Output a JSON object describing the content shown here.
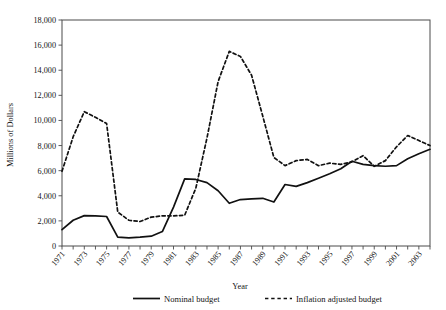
{
  "chart_data": {
    "type": "line",
    "title": "",
    "xlabel": "Year",
    "ylabel": "Millions of Dollars",
    "ylim": [
      0,
      18000
    ],
    "ytick_step": 2000,
    "ytick_labels": [
      "0",
      "2,000",
      "4,000",
      "6,000",
      "8,000",
      "10,000",
      "12,000",
      "14,000",
      "16,000",
      "18,000"
    ],
    "xlim": [
      1971,
      2004
    ],
    "grid": false,
    "legend_position": "bottom",
    "x": [
      1971,
      1972,
      1973,
      1974,
      1975,
      1976,
      1977,
      1978,
      1979,
      1980,
      1981,
      1982,
      1983,
      1984,
      1985,
      1986,
      1987,
      1988,
      1989,
      1990,
      1991,
      1992,
      1993,
      1994,
      1995,
      1996,
      1997,
      1998,
      1999,
      2000,
      2001,
      2002,
      2003,
      2004
    ],
    "xtick_labels": [
      "1971",
      "1973",
      "1975",
      "1977",
      "1979",
      "1981",
      "1983",
      "1985",
      "1987",
      "1989",
      "1991",
      "1993",
      "1995",
      "1997",
      "1999",
      "2001",
      "2003"
    ],
    "series": [
      {
        "name": "Nominal budget",
        "style": "solid",
        "values": [
          1300,
          2050,
          2420,
          2400,
          2350,
          700,
          640,
          700,
          780,
          1150,
          3100,
          5350,
          5300,
          5050,
          4400,
          3400,
          3700,
          3750,
          3800,
          3500,
          4900,
          4750,
          5050,
          5400,
          5750,
          6150,
          6750,
          6500,
          6400,
          6350,
          6400,
          6950,
          7350,
          7700
        ]
      },
      {
        "name": "Inflation adjusted budget",
        "style": "dashed",
        "values": [
          5950,
          8700,
          10700,
          10250,
          9750,
          2700,
          2050,
          1950,
          2300,
          2400,
          2400,
          2450,
          4600,
          8600,
          13100,
          15500,
          15100,
          13600,
          10350,
          7050,
          6400,
          6800,
          6900,
          6400,
          6600,
          6500,
          6700,
          7200,
          6350,
          6800,
          7900,
          8800,
          8400,
          8000
        ]
      }
    ],
    "note_series_full": {
      "nominal": [
        {
          "year": 1971,
          "value": 1300
        },
        {
          "year": 1972,
          "value": 2050
        },
        {
          "year": 1973,
          "value": 2420
        },
        {
          "year": 1974,
          "value": 2400
        },
        {
          "year": 1975,
          "value": 2350
        },
        {
          "year": 1976,
          "value": 700
        },
        {
          "year": 1977,
          "value": 640
        },
        {
          "year": 1978,
          "value": 700
        },
        {
          "year": 1979,
          "value": 780
        },
        {
          "year": 1980,
          "value": 1150
        },
        {
          "year": 1981,
          "value": 3100
        },
        {
          "year": 1982,
          "value": 5350
        },
        {
          "year": 1983,
          "value": 5300
        },
        {
          "year": 1984,
          "value": 5050
        },
        {
          "year": 1985,
          "value": 4400
        },
        {
          "year": 1986,
          "value": 3400
        },
        {
          "year": 1987,
          "value": 3700
        },
        {
          "year": 1988,
          "value": 3750
        },
        {
          "year": 1989,
          "value": 3800
        },
        {
          "year": 1990,
          "value": 3500
        },
        {
          "year": 1991,
          "value": 4900
        },
        {
          "year": 1992,
          "value": 4750
        },
        {
          "year": 1993,
          "value": 5050
        },
        {
          "year": 1994,
          "value": 5400
        },
        {
          "year": 1995,
          "value": 5750
        },
        {
          "year": 1996,
          "value": 6150
        },
        {
          "year": 1997,
          "value": 6750
        },
        {
          "year": 1998,
          "value": 6500
        },
        {
          "year": 1999,
          "value": 6400
        },
        {
          "year": 2000,
          "value": 6350
        },
        {
          "year": 2001,
          "value": 6400
        },
        {
          "year": 2002,
          "value": 6950
        },
        {
          "year": 2003,
          "value": 7350
        },
        {
          "year": 2004,
          "value": 7700
        }
      ],
      "inflation_adjusted": [
        {
          "year": 1971,
          "value": 5950
        },
        {
          "year": 1972,
          "value": 8700
        },
        {
          "year": 1973,
          "value": 10700
        },
        {
          "year": 1974,
          "value": 10250
        },
        {
          "year": 1975,
          "value": 9750
        },
        {
          "year": 1976,
          "value": 2700
        },
        {
          "year": 1977,
          "value": 2050
        },
        {
          "year": 1978,
          "value": 1950
        },
        {
          "year": 1979,
          "value": 2300
        },
        {
          "year": 1980,
          "value": 2400
        },
        {
          "year": 1981,
          "value": 2400
        },
        {
          "year": 1982,
          "value": 2450
        },
        {
          "year": 1983,
          "value": 4600
        },
        {
          "year": 1984,
          "value": 8600
        },
        {
          "year": 1985,
          "value": 13100
        },
        {
          "year": 1986,
          "value": 15500
        },
        {
          "year": 1987,
          "value": 15100
        },
        {
          "year": 1988,
          "value": 13600
        },
        {
          "year": 1989,
          "value": 10350
        },
        {
          "year": 1990,
          "value": 7050
        },
        {
          "year": 1991,
          "value": 6400
        },
        {
          "year": 1992,
          "value": 6800
        },
        {
          "year": 1993,
          "value": 6900
        },
        {
          "year": 1994,
          "value": 6400
        },
        {
          "year": 1995,
          "value": 6600
        },
        {
          "year": 1996,
          "value": 6500
        },
        {
          "year": 1997,
          "value": 6700
        },
        {
          "year": 1998,
          "value": 7200
        },
        {
          "year": 1999,
          "value": 6350
        },
        {
          "year": 2000,
          "value": 6800
        },
        {
          "year": 2001,
          "value": 7900
        },
        {
          "year": 2002,
          "value": 8800
        },
        {
          "year": 2003,
          "value": 8400
        },
        {
          "year": 2004,
          "value": 8000
        }
      ]
    }
  },
  "legend": {
    "items": [
      {
        "label": "Nominal budget",
        "style": "solid"
      },
      {
        "label": "Inflation adjusted budget",
        "style": "dashed"
      }
    ]
  },
  "colors": {
    "line": "#111111",
    "frame": "#4a4a4a",
    "text": "#151515",
    "background": "#ffffff"
  }
}
